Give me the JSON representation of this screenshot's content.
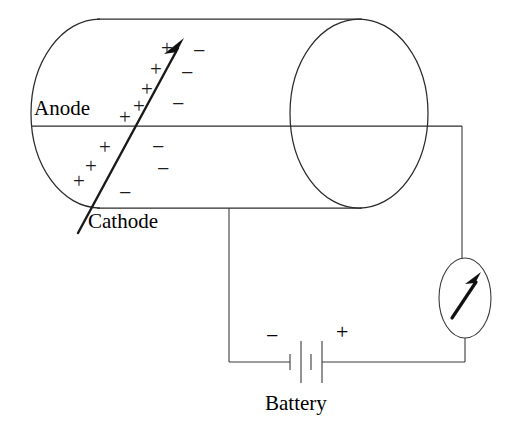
{
  "figure": {
    "background_color": "#ffffff",
    "ink_color": "#1c1c1c",
    "width": 526,
    "height": 436
  },
  "labels": {
    "anode": "Anode",
    "cathode": "Cathode",
    "battery": "Battery",
    "battery_negative_terminal": "−",
    "battery_positive_terminal": "+"
  },
  "charges": {
    "positive_symbol": "+",
    "negative_symbol": "−",
    "positive_count": 9,
    "negative_count": 7,
    "positive_points": [
      {
        "x": 168,
        "y": 48
      },
      {
        "x": 157,
        "y": 68
      },
      {
        "x": 148,
        "y": 88
      },
      {
        "x": 140,
        "y": 105
      },
      {
        "x": 126,
        "y": 116
      },
      {
        "x": 106,
        "y": 146
      },
      {
        "x": 92,
        "y": 165
      },
      {
        "x": 80,
        "y": 180
      }
    ],
    "negative_points": [
      {
        "x": 199,
        "y": 50
      },
      {
        "x": 187,
        "y": 72
      },
      {
        "x": 178,
        "y": 103
      },
      {
        "x": 158,
        "y": 146
      },
      {
        "x": 163,
        "y": 168
      },
      {
        "x": 125,
        "y": 192
      }
    ]
  },
  "components": {
    "tube": {
      "name": "discharge-tube",
      "left_cap_center_x": 100,
      "left_cap_rx": 69,
      "right_cap_center_x": 359,
      "right_cap_rx": 69,
      "top_y": 19,
      "bottom_y": 208,
      "mid_y": 126
    },
    "galvanometer": {
      "name": "galvanometer",
      "center_x": 465,
      "center_y": 298,
      "rx": 26,
      "ry": 40,
      "needle_angle_deg": 55
    },
    "battery": {
      "name": "battery",
      "plate_count": 4,
      "plate_pattern": [
        "short",
        "long",
        "short",
        "long"
      ],
      "wire_y": 362
    },
    "wires": {
      "anode_lead_right_x": 462,
      "cathode_lead_x": 229,
      "bottom_wire_y": 362
    }
  }
}
